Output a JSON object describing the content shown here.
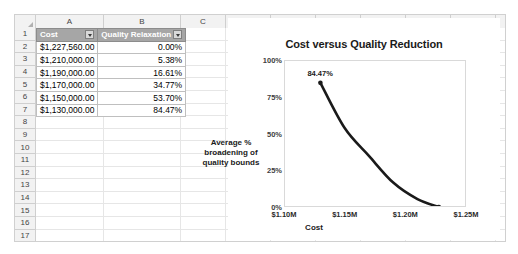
{
  "sheet": {
    "columns": [
      "A",
      "B",
      "C",
      "D",
      "E",
      "F",
      "G",
      "H",
      "I",
      "J",
      "K"
    ],
    "rows": [
      "1",
      "2",
      "3",
      "4",
      "5",
      "6",
      "7",
      "8",
      "9",
      "10",
      "11",
      "12",
      "13",
      "14",
      "15",
      "16",
      "17",
      "18",
      "19"
    ],
    "corner_icon": "select-all-icon"
  },
  "table": {
    "headers": [
      {
        "label": "Cost",
        "filter_icon": "filter-dropdown-icon"
      },
      {
        "label": "Quality Relaxation",
        "filter_icon": "filter-dropdown-icon"
      }
    ],
    "rows": [
      {
        "cost": "$1,227,560.00",
        "quality_relaxation": "0.00%"
      },
      {
        "cost": "$1,210,000.00",
        "quality_relaxation": "5.38%"
      },
      {
        "cost": "$1,190,000.00",
        "quality_relaxation": "16.61%"
      },
      {
        "cost": "$1,170,000.00",
        "quality_relaxation": "34.77%"
      },
      {
        "cost": "$1,150,000.00",
        "quality_relaxation": "53.70%"
      },
      {
        "cost": "$1,130,000.00",
        "quality_relaxation": "84.47%"
      }
    ],
    "header_bg": "#a6a6a6",
    "header_fg": "#ffffff"
  },
  "chart_data": {
    "type": "line",
    "title": "Cost versus Quality Reduction",
    "xlabel": "Cost",
    "ylabel": "Average % broadening of quality bounds",
    "ylabel_lines": [
      "Average %",
      "broadening of",
      "quality bounds"
    ],
    "x": [
      1130000,
      1150000,
      1170000,
      1190000,
      1210000,
      1227560
    ],
    "values": [
      84.47,
      53.7,
      34.77,
      16.61,
      5.38,
      0.0
    ],
    "xlim": [
      1100000,
      1250000
    ],
    "ylim": [
      0,
      100
    ],
    "xticks": [
      1100000,
      1150000,
      1200000,
      1250000
    ],
    "xtick_labels": [
      "$1.10M",
      "$1.15M",
      "$1.20M",
      "$1.25M"
    ],
    "yticks": [
      0,
      25,
      50,
      75,
      100
    ],
    "ytick_labels": [
      "0%",
      "25%",
      "50%",
      "75%",
      "100%"
    ],
    "grid": false,
    "legend": "none",
    "smooth": true,
    "line_color": "#1a1a1a",
    "annotations": [
      {
        "text": "84.47%",
        "x": 1130000,
        "y": 84.47
      }
    ]
  }
}
